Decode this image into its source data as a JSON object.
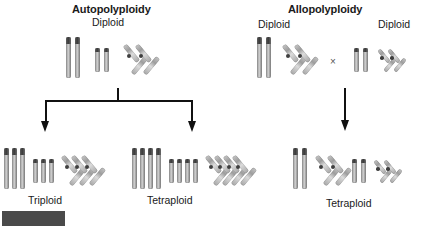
{
  "figure": {
    "kind": "biology-diagram",
    "subject": "polyploidy"
  },
  "left_panel": {
    "title": "Autopolyploidy",
    "parent_label": "Diploid",
    "outcomes": [
      {
        "label": "Triploid",
        "copies": 3
      },
      {
        "label": "Tetraploid",
        "copies": 4
      }
    ]
  },
  "right_panel": {
    "title": "Allopolyploidy",
    "parent_label_left": "Diploid",
    "parent_label_right": "Diploid",
    "cross_symbol": "×",
    "outcome": {
      "label": "Tetraploid"
    }
  },
  "colors": {
    "text": "#1a1a1a",
    "connector": "#111111",
    "chromosome_light": "#d8d8d8",
    "chromosome_mid": "#9d9d9d",
    "chromosome_dark": "#3f3f3f",
    "redaction_block": "#4a4a4a",
    "background": "#ffffff"
  }
}
